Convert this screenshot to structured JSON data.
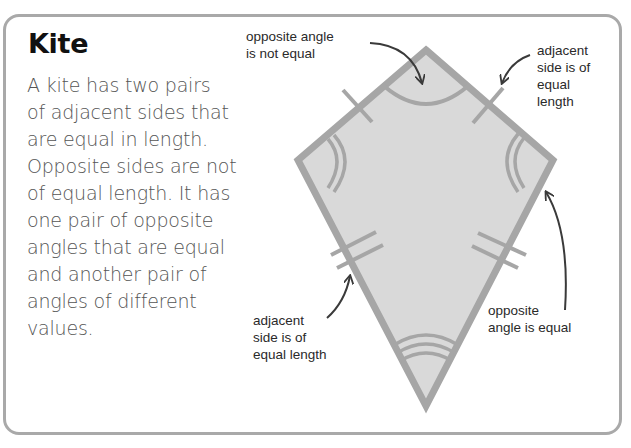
{
  "title": "Kite",
  "description_lines": [
    "A kite has two pairs",
    "of adjacent sides that",
    "are equal in length.",
    "Opposite sides are not",
    "of equal length. It has",
    "one pair of opposite",
    "angles that are equal",
    "and another pair of",
    "angles of different",
    "values."
  ],
  "labels": {
    "top_left": [
      "opposite angle",
      "is not equal"
    ],
    "top_right": [
      "adjacent",
      "side is of",
      "equal",
      "length"
    ],
    "bottom_left": [
      "adjacent",
      "side is of",
      "equal length"
    ],
    "bottom_right": [
      "opposite",
      "angle is equal"
    ]
  },
  "colors": {
    "kite_fill": "#d9d9d9",
    "kite_stroke": "#a6a6a6",
    "arrow": "#3a3a3a",
    "card_border": "#a9a9a9"
  }
}
